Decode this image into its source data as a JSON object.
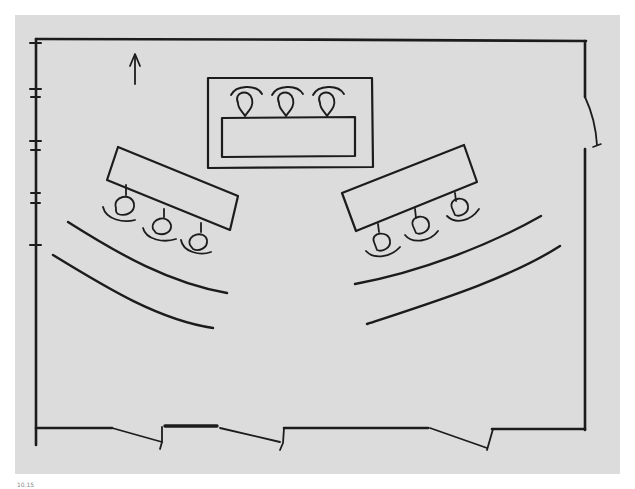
{
  "diagram": {
    "type": "hand-drawn floor plan",
    "background_color": "#dcdcdc",
    "line_color": "#1c1c1c",
    "labels": {
      "north": "N",
      "supervisors": "Supervisors",
      "platform": "PlaTform",
      "pa_mic": {
        "line1": "P.A. mic sysTem",
        "line2": "available"
      },
      "windows": {
        "line1": "Windows",
        "line2": "wiThouT",
        "line3": "curTains"
      },
      "side_door": "4'-wide door",
      "attorneys": {
        "line1": "ATTorneys",
        "line2": "and wiTnesses"
      },
      "media": {
        "line1": "Media and",
        "line2": "specTaTor benches"
      },
      "bottom_doors": [
        "6'-wide door",
        "6'-wide door",
        "6'-wide door"
      ]
    },
    "elements": {
      "supervisor_chairs": 3,
      "left_table_chairs": 3,
      "right_table_chairs": 3,
      "bench_rows_per_side": 2,
      "window_markers": 4
    }
  },
  "caption": "10.15"
}
